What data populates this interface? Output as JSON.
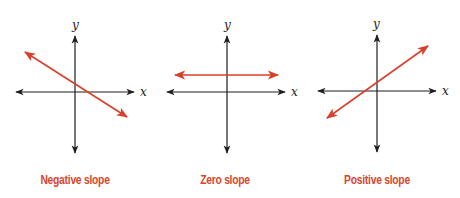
{
  "colors": {
    "axis": "#1f1f1f",
    "line": "#d9402a",
    "label": "#d9452e"
  },
  "panels": [
    {
      "id": "negative",
      "caption": "Negative slope",
      "x_axis_label": "x",
      "y_axis_label": "y",
      "slope": "negative"
    },
    {
      "id": "zero",
      "caption": "Zero slope",
      "x_axis_label": "x",
      "y_axis_label": "y",
      "slope": "zero"
    },
    {
      "id": "positive",
      "caption": "Positive slope",
      "x_axis_label": "x",
      "y_axis_label": "y",
      "slope": "positive"
    }
  ]
}
